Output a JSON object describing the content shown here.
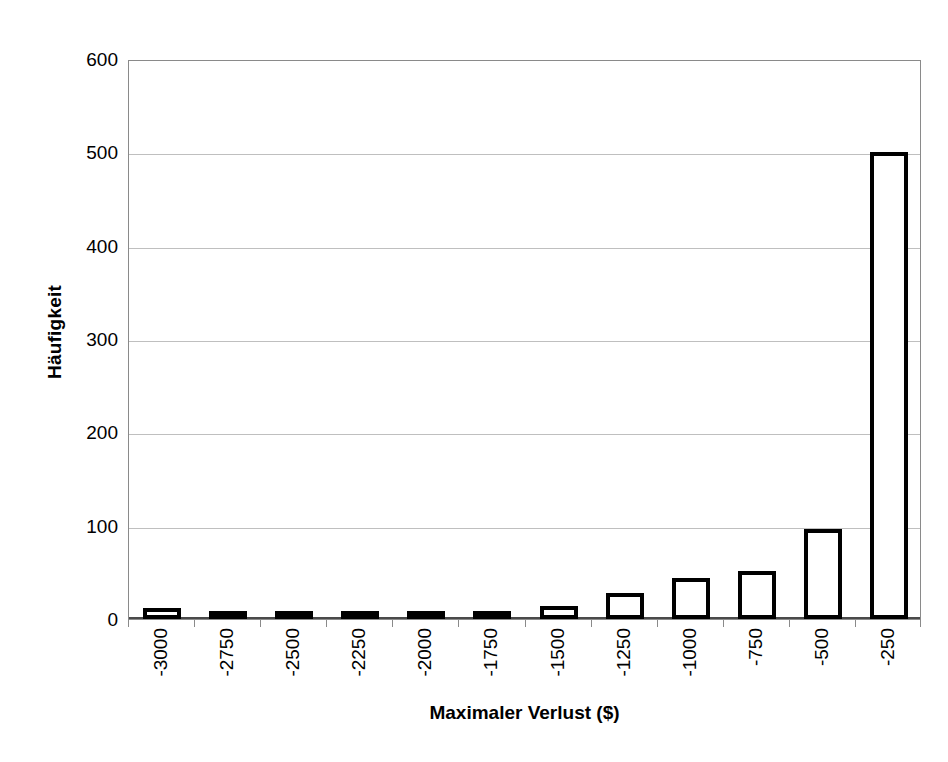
{
  "chart_data": {
    "type": "bar",
    "title": "",
    "subtitle": "",
    "xlabel": "Maximaler Verlust ($)",
    "ylabel": "Häufigkeit",
    "categories": [
      "-3000",
      "-2750",
      "-2500",
      "-2250",
      "-2000",
      "-1750",
      "-1500",
      "-1250",
      "-1000",
      "-750",
      "-500",
      "-250"
    ],
    "values": [
      12,
      3,
      6,
      5,
      9,
      2,
      14,
      28,
      44,
      51,
      96,
      500
    ],
    "ylim": [
      0,
      600
    ],
    "ytick_labels": [
      "0",
      "100",
      "200",
      "300",
      "400",
      "500",
      "600"
    ],
    "ytick_values": [
      0,
      100,
      200,
      300,
      400,
      500,
      600
    ],
    "grid": true,
    "grid_axis": "y",
    "legend": false,
    "legend_position": "none",
    "bar_style": {
      "fill_color": "#ffffff",
      "edge_color": "#000000",
      "edge_width_px": 4
    },
    "colors": {
      "background": "#ffffff",
      "gridline": "#bfbfbf",
      "frame": "#8a8a8a",
      "axis": "#4a4a4a",
      "text": "#000000"
    },
    "annotations": []
  }
}
